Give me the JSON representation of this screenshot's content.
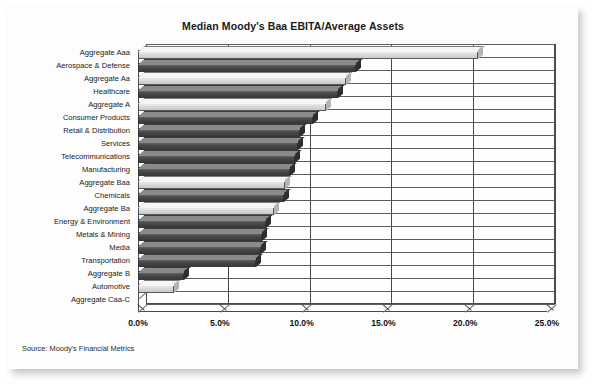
{
  "chart_data": {
    "type": "bar",
    "orientation": "horizontal",
    "title": "Median Moody's Baa EBITA/Average Assets",
    "xlabel": "",
    "ylabel": "",
    "xlim": [
      0,
      25
    ],
    "xticks": [
      "0.0%",
      "5.0%",
      "10.0%",
      "15.0%",
      "20.0%",
      "25.0%"
    ],
    "xtick_values": [
      0,
      5,
      10,
      15,
      20,
      25
    ],
    "grid": true,
    "legend": null,
    "source": "Source: Moody's Financial Metrics",
    "categories": [
      "Aggregate Aaa",
      "Aerospace & Defense",
      "Aggregate Aa",
      "Healthcare",
      "Aggregate A",
      "Consumer Products",
      "Retail & Distribution",
      "Services",
      "Telecommunications",
      "Manufacturing",
      "Aggregate Baa",
      "Chemicals",
      "Aggregate Ba",
      "Energy & Environment",
      "Metals & Mining",
      "Media",
      "Transportation",
      "Aggregate B",
      "Automotive",
      "Aggregate Caa-C"
    ],
    "values": [
      20.8,
      13.3,
      12.7,
      12.2,
      11.5,
      10.7,
      9.9,
      9.8,
      9.6,
      9.3,
      9.0,
      8.9,
      8.3,
      7.8,
      7.6,
      7.5,
      7.2,
      2.8,
      2.2,
      0.0
    ],
    "series_style": [
      "light",
      "dark",
      "light",
      "dark",
      "light",
      "dark",
      "dark",
      "dark",
      "dark",
      "dark",
      "light",
      "dark",
      "light",
      "dark",
      "dark",
      "dark",
      "dark",
      "dark",
      "light",
      "light"
    ],
    "colors": {
      "aggregate_bar": "#dcdcdc",
      "industry_bar": "#4a4a4a",
      "axis": "#4a4a4a",
      "background": "#fdfdfd",
      "text": "#1a1a1a"
    }
  }
}
